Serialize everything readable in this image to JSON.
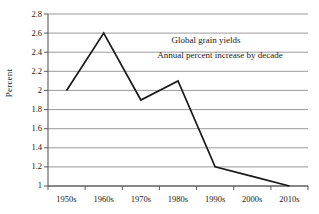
{
  "chart_data": {
    "type": "line",
    "title": "",
    "annotations": [
      "Global grain yields",
      "Annual percent increase by decade"
    ],
    "categories": [
      "1950s",
      "1960s",
      "1970s",
      "1980s",
      "1990s",
      "2000s",
      "2010s"
    ],
    "values": [
      2.0,
      2.6,
      1.9,
      2.1,
      1.2,
      1.1,
      1.0
    ],
    "series": [
      {
        "name": "Global grain yields",
        "values": [
          2.0,
          2.6,
          1.9,
          2.1,
          1.2,
          1.1,
          1.0
        ]
      }
    ],
    "xlabel": "",
    "ylabel": "Percent",
    "ylim": [
      1,
      2.8
    ],
    "ytick_labels": [
      "1",
      "1.2",
      "1.4",
      "1.6",
      "1.8",
      "2",
      "2.2",
      "2.4",
      "2.6",
      "2.8"
    ],
    "ytick_values": [
      1,
      1.2,
      1.4,
      1.6,
      1.8,
      2,
      2.2,
      2.4,
      2.6,
      2.8
    ],
    "grid": true,
    "grid_axis": "y",
    "legend": false,
    "legend_position": "none",
    "line_color": "#1a1a1a",
    "grid_color": "#9a9a9a",
    "axis_color": "#5a5a5a",
    "background_color": "#ffffff"
  }
}
